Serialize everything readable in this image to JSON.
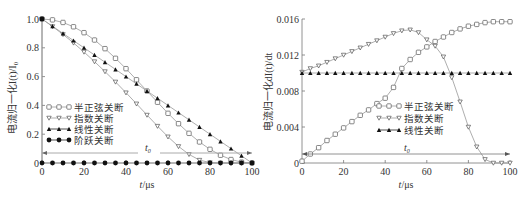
{
  "chart_data": [
    {
      "type": "line",
      "title": "",
      "xlabel": "t/μs",
      "ylabel": "电流归一化I(t)/I0",
      "xlim": [
        0,
        100
      ],
      "ylim": [
        0,
        1.0
      ],
      "xticks": [
        0,
        20,
        40,
        60,
        80,
        100
      ],
      "yticks": [
        0,
        0.2,
        0.4,
        0.6,
        0.8,
        1.0
      ],
      "ytick_labels": [
        "0",
        "0.2",
        "0.4",
        "0.6",
        "0.8",
        "1.0"
      ],
      "grid": false,
      "legend_position": "lower-left",
      "annotation": {
        "text": "t0",
        "type": "double-arrow span",
        "x_from": 0,
        "x_to": 100,
        "y": 0.07
      },
      "series": [
        {
          "name": "半正弦关断",
          "marker": "open-circle",
          "x": [
            0,
            5,
            10,
            15,
            20,
            25,
            30,
            35,
            40,
            45,
            50,
            55,
            60,
            65,
            70,
            75,
            80,
            85,
            90,
            95,
            100
          ],
          "y": [
            1.0,
            0.994,
            0.976,
            0.946,
            0.905,
            0.854,
            0.794,
            0.727,
            0.655,
            0.578,
            0.5,
            0.422,
            0.345,
            0.273,
            0.206,
            0.146,
            0.095,
            0.054,
            0.024,
            0.006,
            0.0
          ]
        },
        {
          "name": "指数关断",
          "marker": "open-triangle-down",
          "x": [
            0,
            5,
            10,
            15,
            20,
            25,
            30,
            35,
            40,
            45,
            50,
            55,
            60,
            65,
            70,
            75,
            80,
            85,
            90,
            95,
            100
          ],
          "y": [
            1.0,
            0.948,
            0.893,
            0.834,
            0.771,
            0.704,
            0.635,
            0.563,
            0.488,
            0.411,
            0.333,
            0.256,
            0.182,
            0.115,
            0.06,
            0.02,
            0.003,
            0.0,
            0.0,
            0.0,
            0.0
          ]
        },
        {
          "name": "线性关断",
          "marker": "filled-triangle",
          "x": [
            0,
            5,
            10,
            15,
            20,
            25,
            30,
            35,
            40,
            45,
            50,
            55,
            60,
            65,
            70,
            75,
            80,
            85,
            90,
            95,
            100
          ],
          "y": [
            1.0,
            0.95,
            0.9,
            0.85,
            0.8,
            0.75,
            0.7,
            0.65,
            0.6,
            0.55,
            0.5,
            0.45,
            0.4,
            0.35,
            0.3,
            0.25,
            0.2,
            0.15,
            0.1,
            0.05,
            0.0
          ]
        },
        {
          "name": "阶跃关断",
          "marker": "filled-circle",
          "x": [
            0,
            0,
            5,
            10,
            15,
            20,
            25,
            30,
            35,
            40,
            45,
            50,
            55,
            60,
            65,
            70,
            75,
            80,
            85,
            90,
            95,
            100
          ],
          "y": [
            1.0,
            0.0,
            0.0,
            0.0,
            0.0,
            0.0,
            0.0,
            0.0,
            0.0,
            0.0,
            0.0,
            0.0,
            0.0,
            0.0,
            0.0,
            0.0,
            0.0,
            0.0,
            0.0,
            0.0,
            0.0,
            0.0
          ]
        }
      ]
    },
    {
      "type": "line",
      "title": "",
      "xlabel": "t/μs",
      "ylabel": "电流归一化dI(t)/dt",
      "xlim": [
        0,
        100
      ],
      "ylim": [
        0,
        0.016
      ],
      "xticks": [
        0,
        20,
        40,
        60,
        80,
        100
      ],
      "yticks": [
        0,
        0.004,
        0.008,
        0.012,
        0.016
      ],
      "ytick_labels": [
        "0",
        "0.004",
        "0.008",
        "0.012",
        "0.016"
      ],
      "grid": false,
      "legend_position": "center",
      "annotation": {
        "text": "t0",
        "type": "double-arrow span",
        "x_from": 0,
        "x_to": 100,
        "y": 0.001
      },
      "series": [
        {
          "name": "半正弦关断",
          "marker": "open-circle",
          "x": [
            0,
            4,
            8,
            12,
            16,
            20,
            24,
            28,
            32,
            36,
            40,
            44,
            48,
            52,
            56,
            60,
            64,
            68,
            72,
            76,
            80,
            84,
            88,
            92,
            96,
            100
          ],
          "y": [
            0.0002,
            0.001,
            0.0017,
            0.0025,
            0.0032,
            0.0039,
            0.0046,
            0.0053,
            0.0059,
            0.0066,
            0.0072,
            0.0084,
            0.0105,
            0.0115,
            0.0123,
            0.0129,
            0.0135,
            0.014,
            0.0145,
            0.0149,
            0.0152,
            0.0154,
            0.0156,
            0.0157,
            0.0157,
            0.0157
          ]
        },
        {
          "name": "指数关断",
          "marker": "open-triangle-down",
          "x": [
            0,
            4,
            8,
            12,
            16,
            20,
            24,
            28,
            32,
            36,
            40,
            44,
            48,
            52,
            56,
            60,
            64,
            68,
            72,
            76,
            80,
            84,
            88,
            92,
            96,
            100
          ],
          "y": [
            0.0101,
            0.0105,
            0.0108,
            0.0112,
            0.0116,
            0.012,
            0.0124,
            0.0128,
            0.0132,
            0.0136,
            0.014,
            0.0144,
            0.0147,
            0.0148,
            0.0145,
            0.0137,
            0.013,
            0.0118,
            0.0095,
            0.0068,
            0.004,
            0.0018,
            0.0004,
            0.0,
            0.0,
            0.0
          ]
        },
        {
          "name": "线性关断",
          "marker": "filled-triangle",
          "x": [
            0,
            4,
            8,
            12,
            16,
            20,
            24,
            28,
            32,
            36,
            40,
            44,
            48,
            52,
            56,
            60,
            64,
            68,
            72,
            76,
            80,
            84,
            88,
            92,
            96,
            100
          ],
          "y": [
            0.01,
            0.01,
            0.01,
            0.01,
            0.01,
            0.01,
            0.01,
            0.01,
            0.01,
            0.01,
            0.01,
            0.01,
            0.01,
            0.01,
            0.01,
            0.01,
            0.01,
            0.01,
            0.01,
            0.01,
            0.01,
            0.01,
            0.01,
            0.01,
            0.01,
            0.01
          ]
        }
      ]
    }
  ],
  "left_chart": {
    "ylabel_main": "电流归一化I(t)/I",
    "ylabel_sub": "0",
    "xlabel_t": "t",
    "xlabel_unit": "/μs",
    "t0_label": "t",
    "t0_sub": "0",
    "legend": [
      "半正弦关断",
      "指数关断",
      "线性关断",
      "阶跃关断"
    ],
    "xtick_labels": [
      "0",
      "20",
      "40",
      "60",
      "80",
      "100"
    ],
    "ytick_labels": [
      "0",
      "0.2",
      "0.4",
      "0.6",
      "0.8",
      "1.0"
    ]
  },
  "right_chart": {
    "ylabel_main": "电流归一化dI(t)/dt",
    "xlabel_t": "t",
    "xlabel_unit": "/μs",
    "t0_label": "t",
    "t0_sub": "0",
    "legend": [
      "半正弦关断",
      "指数关断",
      "线性关断"
    ],
    "xtick_labels": [
      "0",
      "20",
      "40",
      "60",
      "80",
      "100"
    ],
    "ytick_labels": [
      "0",
      "0.004",
      "0.008",
      "0.012",
      "0.016"
    ]
  },
  "colors": {
    "axis": "#777777",
    "curve": "#999999",
    "marker_dark": "#111111",
    "text": "#333333"
  }
}
